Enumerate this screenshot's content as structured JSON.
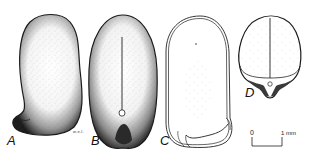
{
  "figure": {
    "panels": [
      {
        "id": "A",
        "label": "A",
        "view": "lateral view, stippled seed"
      },
      {
        "id": "B",
        "label": "B",
        "view": "ventral view with central line and hilum"
      },
      {
        "id": "C",
        "label": "C",
        "view": "outline / section view"
      },
      {
        "id": "D",
        "label": "D",
        "view": "cross-section with central division"
      }
    ],
    "signature": "w.e.l.",
    "scale_bar": {
      "start_label": "0",
      "end_label": "1 mm"
    }
  },
  "colors": {
    "ink": "#111111",
    "paper": "#ffffff"
  }
}
